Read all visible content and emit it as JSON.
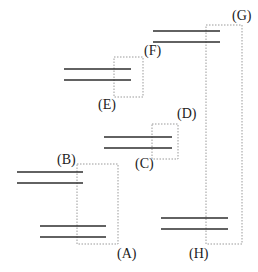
{
  "diagram": {
    "type": "energy-level-pairs",
    "colors": {
      "line": "#2e2e2e",
      "dotted_box": "#9a9a9a",
      "label": "#222222"
    },
    "labels": {
      "A": "(A)",
      "B": "(B)",
      "C": "(C)",
      "D": "(D)",
      "E": "(E)",
      "F": "(F)",
      "G": "(G)",
      "H": "(H)"
    },
    "line_pairs": [
      {
        "id": "pair-G",
        "x1": 153,
        "x2": 220,
        "y_top": 31,
        "y_bottom": 42
      },
      {
        "id": "pair-EF",
        "x1": 64,
        "x2": 131,
        "y_top": 69,
        "y_bottom": 80
      },
      {
        "id": "pair-CD",
        "x1": 104,
        "x2": 172,
        "y_top": 137,
        "y_bottom": 148
      },
      {
        "id": "pair-B",
        "x1": 17,
        "x2": 83,
        "y_top": 172,
        "y_bottom": 183
      },
      {
        "id": "pair-A",
        "x1": 40,
        "x2": 106,
        "y_top": 226,
        "y_bottom": 237
      },
      {
        "id": "pair-H",
        "x1": 161,
        "x2": 228,
        "y_top": 218,
        "y_bottom": 229
      }
    ],
    "dotted_boxes": [
      {
        "id": "box-GH",
        "x": 206,
        "y": 25,
        "w": 36,
        "h": 219
      },
      {
        "id": "box-EF",
        "x": 114,
        "y": 57,
        "w": 29,
        "h": 40
      },
      {
        "id": "box-CD",
        "x": 152,
        "y": 124,
        "w": 26,
        "h": 35
      },
      {
        "id": "box-AB",
        "x": 77,
        "y": 164,
        "w": 41,
        "h": 80
      }
    ]
  }
}
